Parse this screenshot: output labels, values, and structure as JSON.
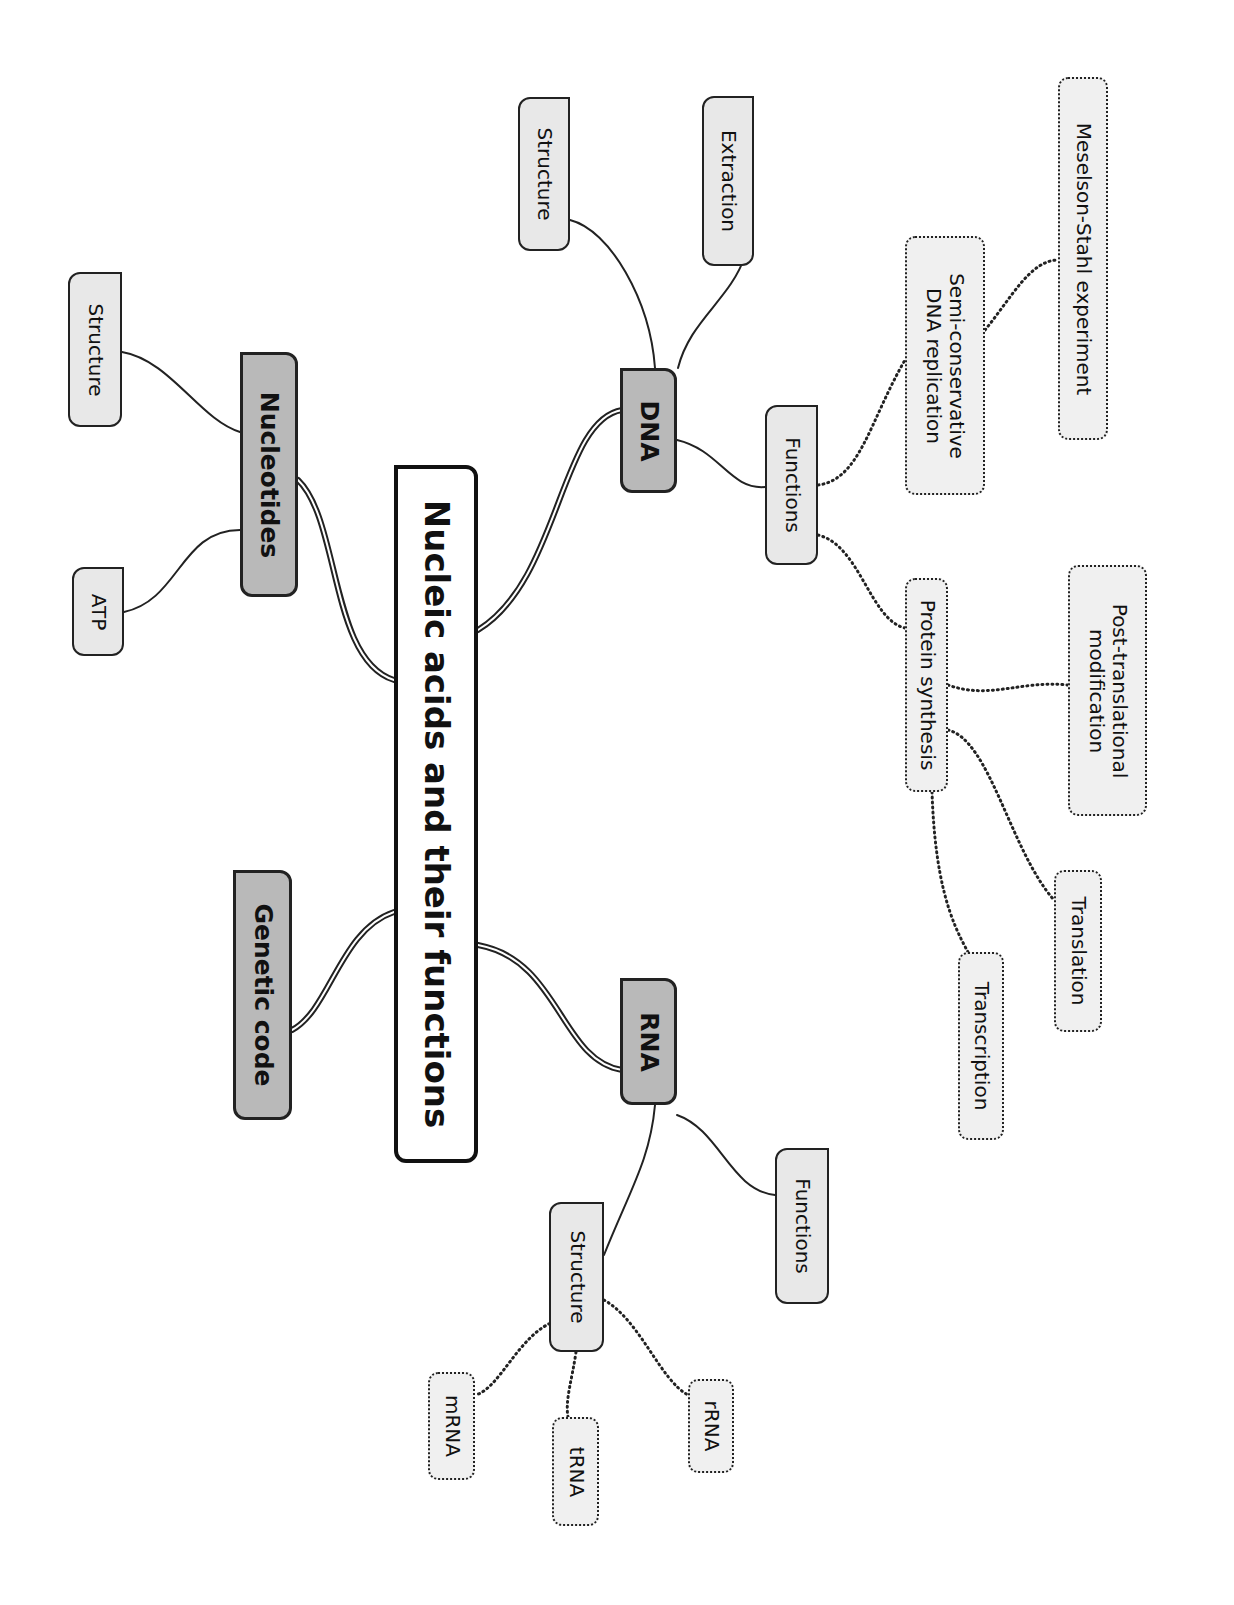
{
  "title": "Nucleic acids and their functions",
  "colors": {
    "root_fill": "#ffffff",
    "main_fill": "#b9b9b9",
    "sub_fill": "#e8e8e8",
    "leaf_fill": "#f0f0f0",
    "line": "#222222"
  },
  "orientation": "rotated 90 degrees clockwise",
  "branches": {
    "dna": {
      "label": "DNA",
      "children": {
        "structure": "Structure",
        "extraction": "Extraction",
        "functions": {
          "label": "Functions",
          "children": {
            "semi_conservative": "Semi-conservative\nDNA replication",
            "meselson_stahl": "Meselson-Stahl experiment",
            "protein_synthesis": {
              "label": "Protein synthesis",
              "children": {
                "post_translational": "Post-translational\nmodification",
                "translation": "Translation",
                "transcription": "Transcription"
              }
            }
          }
        }
      }
    },
    "rna": {
      "label": "RNA",
      "children": {
        "functions": "Functions",
        "structure": {
          "label": "Structure",
          "children": {
            "mrna": "mRNA",
            "trna": "tRNA",
            "rrna": "rRNA"
          }
        }
      }
    },
    "nucleotides": {
      "label": "Nucleotides",
      "children": {
        "structure": "Structure",
        "atp": "ATP"
      }
    },
    "genetic_code": {
      "label": "Genetic code"
    }
  }
}
